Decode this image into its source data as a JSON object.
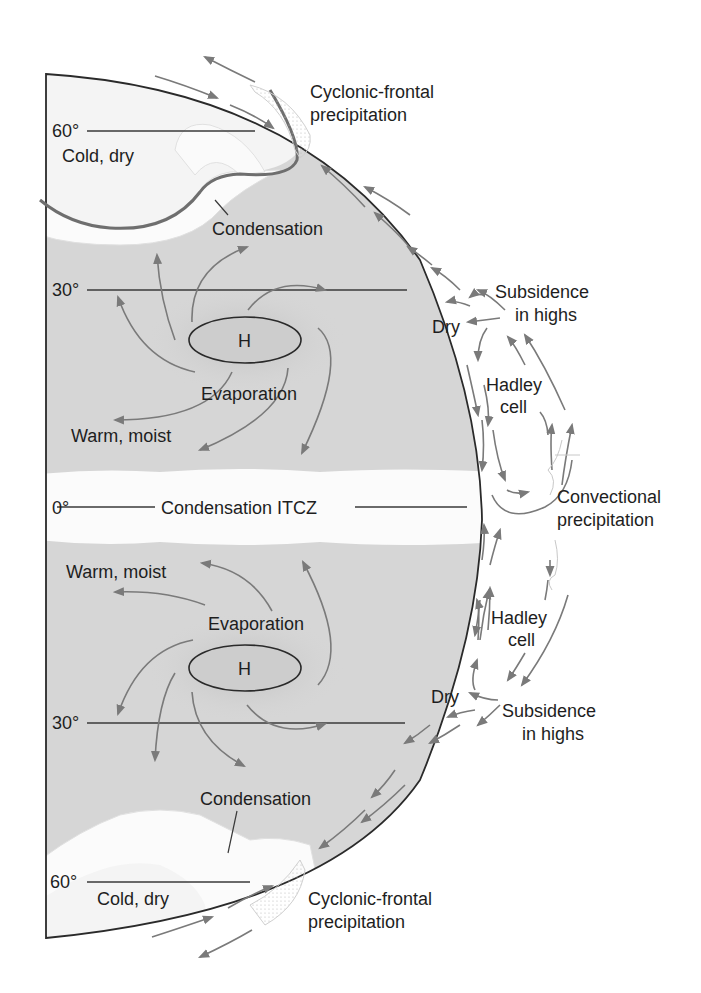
{
  "diagram": {
    "colors": {
      "land_shade": "#d6d6d6",
      "polar_zone": "#f2f2f2",
      "cloud": "#fafafa",
      "outline": "#2a2a2a",
      "arrow": "#7a7a7a",
      "front": "#6e6e6e",
      "text": "#1e1e1e"
    },
    "latitudes": {
      "north_60": "60°",
      "north_30": "30°",
      "equator": "0°",
      "south_30": "30°",
      "south_60": "60°"
    },
    "north": {
      "polar_label": "Cold, dry",
      "front_label_line1": "Cyclonic-frontal",
      "front_label_line2": "precipitation",
      "condensation_label": "Condensation",
      "high_label": "H",
      "evaporation_label": "Evaporation",
      "warm_label": "Warm, moist",
      "dry_label": "Dry",
      "subsidence_line1": "Subsidence",
      "subsidence_line2": "in highs",
      "hadley_line1": "Hadley",
      "hadley_line2": "cell"
    },
    "equator": {
      "itcz_label": "Condensation ITCZ",
      "convection_line1": "Convectional",
      "convection_line2": "precipitation"
    },
    "south": {
      "warm_label": "Warm, moist",
      "evaporation_label": "Evaporation",
      "high_label": "H",
      "dry_label": "Dry",
      "subsidence_line1": "Subsidence",
      "subsidence_line2": "in highs",
      "hadley_line1": "Hadley",
      "hadley_line2": "cell",
      "condensation_label": "Condensation",
      "polar_label": "Cold, dry",
      "front_label_line1": "Cyclonic-frontal",
      "front_label_line2": "precipitation"
    }
  }
}
